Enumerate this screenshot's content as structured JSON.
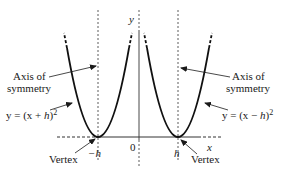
{
  "diagram": {
    "type": "parabola-translation",
    "colors": {
      "ink": "#1a1a1a",
      "axis": "#333333",
      "background": "#ffffff"
    },
    "axes": {
      "x_label": "x",
      "y_label": "y",
      "origin_label": "0"
    },
    "ticks": {
      "neg_h": "−h",
      "pos_h": "h"
    },
    "left_curve": {
      "equation": "y = (x + h)²",
      "eq_prefix": "y = (x + ",
      "eq_h": "h",
      "eq_suffix": ")",
      "eq_exp": "2",
      "axis_label_line1": "Axis of",
      "axis_label_line2": "symmetry",
      "vertex_label": "Vertex"
    },
    "right_curve": {
      "equation": "y = (x − h)²",
      "eq_prefix": "y = (x − ",
      "eq_h": "h",
      "eq_suffix": ")",
      "eq_exp": "2",
      "axis_label_line1": "Axis of",
      "axis_label_line2": "symmetry",
      "vertex_label": "Vertex"
    }
  }
}
